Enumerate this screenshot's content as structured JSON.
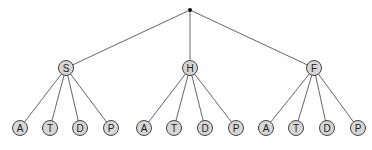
{
  "diagram": {
    "type": "tree",
    "colors": {
      "node_fill": "#d6d6d6",
      "node_stroke": "#444444",
      "edge": "#555555",
      "label": "#222222",
      "root": "#111111"
    },
    "root": {
      "id": "root",
      "label": "",
      "x": 190,
      "y": 10
    },
    "nodes": [
      {
        "id": "S",
        "label": "S",
        "x": 66,
        "y": 68,
        "parent": "root"
      },
      {
        "id": "H",
        "label": "H",
        "x": 190,
        "y": 68,
        "parent": "root"
      },
      {
        "id": "F",
        "label": "F",
        "x": 314,
        "y": 68,
        "parent": "root"
      },
      {
        "id": "S-A",
        "label": "A",
        "x": 20,
        "y": 128,
        "parent": "S"
      },
      {
        "id": "S-T",
        "label": "T",
        "x": 50,
        "y": 128,
        "parent": "S"
      },
      {
        "id": "S-D",
        "label": "D",
        "x": 80,
        "y": 128,
        "parent": "S"
      },
      {
        "id": "S-P",
        "label": "P",
        "x": 111,
        "y": 128,
        "parent": "S"
      },
      {
        "id": "H-A",
        "label": "A",
        "x": 144,
        "y": 128,
        "parent": "H"
      },
      {
        "id": "H-T",
        "label": "T",
        "x": 174,
        "y": 128,
        "parent": "H"
      },
      {
        "id": "H-D",
        "label": "D",
        "x": 205,
        "y": 128,
        "parent": "H"
      },
      {
        "id": "H-P",
        "label": "P",
        "x": 236,
        "y": 128,
        "parent": "H"
      },
      {
        "id": "F-A",
        "label": "A",
        "x": 266,
        "y": 128,
        "parent": "F"
      },
      {
        "id": "F-T",
        "label": "T",
        "x": 296,
        "y": 128,
        "parent": "F"
      },
      {
        "id": "F-D",
        "label": "D",
        "x": 327,
        "y": 128,
        "parent": "F"
      },
      {
        "id": "F-P",
        "label": "P",
        "x": 358,
        "y": 128,
        "parent": "F"
      }
    ],
    "node_radius": 7.5
  }
}
